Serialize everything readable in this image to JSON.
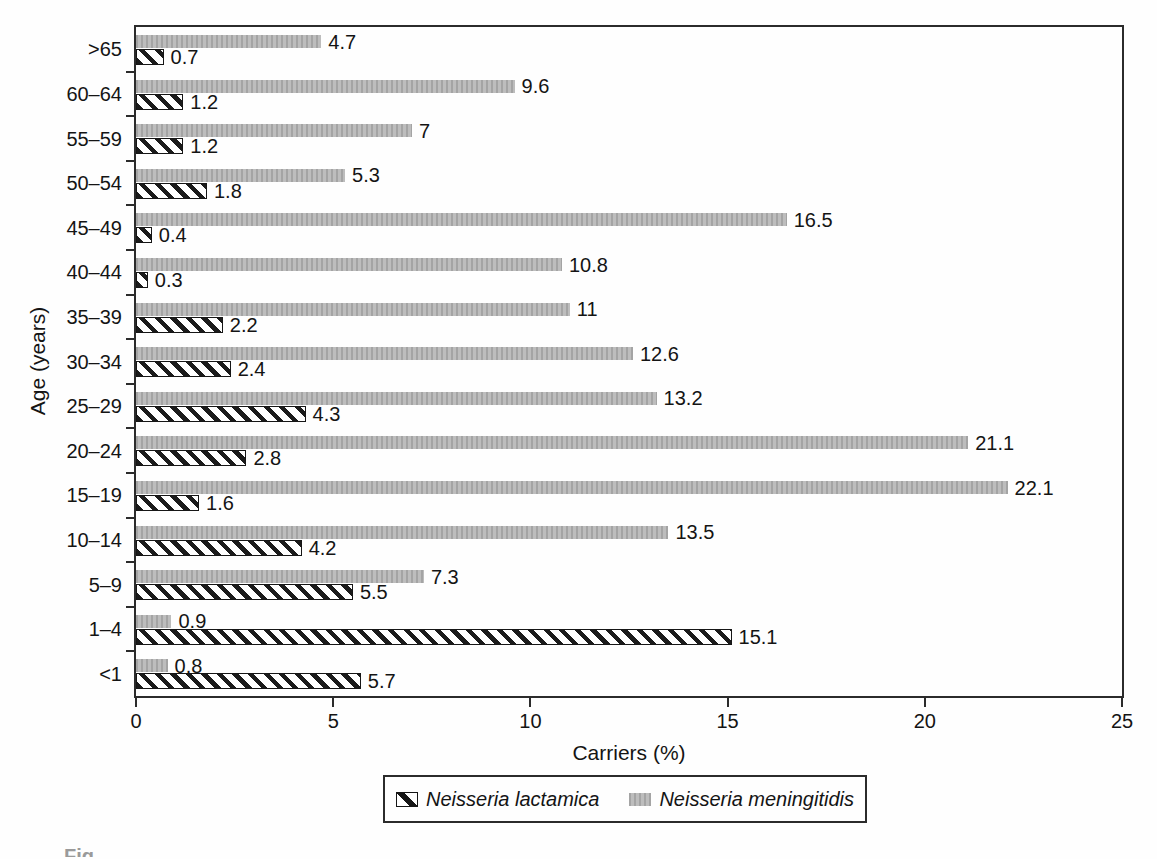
{
  "figure": {
    "caption_fragment": "Fig.",
    "background": "#fefefe"
  },
  "chart_data": {
    "type": "bar",
    "orientation": "horizontal",
    "title": "",
    "xlabel": "Carriers (%)",
    "ylabel": "Age (years)",
    "xlim": [
      0,
      25
    ],
    "x_ticks": [
      0,
      5,
      10,
      15,
      20,
      25
    ],
    "grid": false,
    "legend_position": "bottom-center",
    "categories_top_to_bottom": [
      ">65",
      "60–64",
      "55–59",
      "50–54",
      "45–49",
      "40–44",
      "35–39",
      "30–34",
      "25–29",
      "20–24",
      "15–19",
      "10–14",
      "5–9",
      "1–4",
      "<1"
    ],
    "series": [
      {
        "name": "Neisseria meningitidis",
        "style": "gray-stipple",
        "values_top_to_bottom": [
          4.7,
          9.6,
          7,
          5.3,
          16.5,
          10.8,
          11,
          12.6,
          13.2,
          21.1,
          22.1,
          13.5,
          7.3,
          0.9,
          0.8
        ],
        "labels_top_to_bottom": [
          "4.7",
          "9.6",
          "7",
          "5.3",
          "16.5",
          "10.8",
          "11",
          "12.6",
          "13.2",
          "21.1",
          "22.1",
          "13.5",
          "7.3",
          "0.9",
          "0.8"
        ]
      },
      {
        "name": "Neisseria lactamica",
        "style": "diagonal-hatch",
        "values_top_to_bottom": [
          0.7,
          1.2,
          1.2,
          1.8,
          0.4,
          0.3,
          2.2,
          2.4,
          4.3,
          2.8,
          1.6,
          4.2,
          5.5,
          15.1,
          5.7
        ],
        "labels_top_to_bottom": [
          "0.7",
          "1.2",
          "1.2",
          "1.8",
          "0.4",
          "0.3",
          "2.2",
          "2.4",
          "4.3",
          "2.8",
          "1.6",
          "4.2",
          "5.5",
          "15.1",
          "5.7"
        ]
      }
    ],
    "colors": {
      "meningitidis_fill": "#bdbdbd",
      "meningitidis_stipple": "#a4a4a4",
      "hatch_stroke": "#1b1b1b",
      "axis": "#2b2b2b",
      "label_text": "#141414"
    }
  },
  "legend": {
    "items": [
      {
        "label": "Neisseria lactamica",
        "swatch": "diagonal-hatch"
      },
      {
        "label": "Neisseria meningitidis",
        "swatch": "gray-stipple"
      }
    ]
  }
}
